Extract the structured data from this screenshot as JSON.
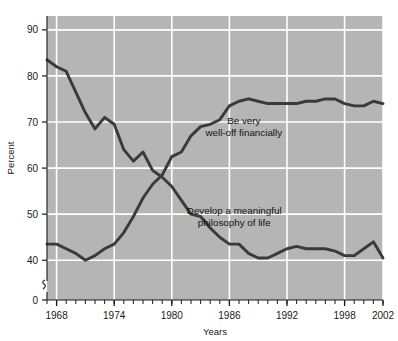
{
  "chart_data": {
    "type": "line",
    "title": "",
    "subtitle": "",
    "xlabel": "Years",
    "ylabel": "Percent",
    "xlim": [
      1967,
      2002
    ],
    "ylim": [
      35.5,
      93
    ],
    "y_axis_break": true,
    "y_break_value": 0,
    "grid": true,
    "grid_color": "#ffffff",
    "plot_background": "#b5b5b5",
    "line_color": "#3a3a3a",
    "legend": "annotations-inline",
    "xticks_major": [
      1968,
      1974,
      1980,
      1986,
      1992,
      1998,
      2002
    ],
    "xtick_labels": [
      "1968",
      "1974",
      "1980",
      "1986",
      "1992",
      "1998",
      "2002"
    ],
    "xticks_minor_every": 1,
    "yticks": [
      0,
      40,
      50,
      60,
      70,
      80,
      90
    ],
    "ytick_labels": [
      "0",
      "40",
      "50",
      "60",
      "70",
      "80",
      "90"
    ],
    "annotations": [
      {
        "id": "well-off",
        "text_line1": "Be very",
        "text_line2": "well-off financially",
        "x": 1987.5,
        "y": 69.5
      },
      {
        "id": "philosophy",
        "text_line1": "Develop a meaningful",
        "text_line2": "philosophy of life",
        "x": 1986.5,
        "y": 50.0
      }
    ],
    "series": [
      {
        "name": "Develop a meaningful philosophy of life",
        "x": [
          1967,
          1968,
          1969,
          1970,
          1971,
          1972,
          1973,
          1974,
          1975,
          1976,
          1977,
          1978,
          1979,
          1980,
          1981,
          1982,
          1983,
          1984,
          1985,
          1986,
          1987,
          1988,
          1989,
          1990,
          1991,
          1992,
          1993,
          1994,
          1995,
          1996,
          1997,
          1998,
          1999,
          2000,
          2001,
          2002
        ],
        "values": [
          83.5,
          82.0,
          81.0,
          76.5,
          72.0,
          68.5,
          71.0,
          69.5,
          64.0,
          61.5,
          63.5,
          59.5,
          58.0,
          56.0,
          53.0,
          50.0,
          49.5,
          47.0,
          45.0,
          43.5,
          43.5,
          41.5,
          40.5,
          40.5,
          41.5,
          42.5,
          43.0,
          42.5,
          42.5,
          42.5,
          42.0,
          41.0,
          41.0,
          42.5,
          44.0,
          40.5
        ]
      },
      {
        "name": "Be very well-off financially",
        "x": [
          1967,
          1968,
          1969,
          1970,
          1971,
          1972,
          1973,
          1974,
          1975,
          1976,
          1977,
          1978,
          1979,
          1980,
          1981,
          1982,
          1983,
          1984,
          1985,
          1986,
          1987,
          1988,
          1989,
          1990,
          1991,
          1992,
          1993,
          1994,
          1995,
          1996,
          1997,
          1998,
          1999,
          2000,
          2001,
          2002
        ],
        "values": [
          43.5,
          43.5,
          42.5,
          41.5,
          40.0,
          41.0,
          42.5,
          43.5,
          46.0,
          49.5,
          53.5,
          56.5,
          58.5,
          62.5,
          63.5,
          67.0,
          69.0,
          69.5,
          70.5,
          73.5,
          74.5,
          75.0,
          74.5,
          74.0,
          74.0,
          74.0,
          74.0,
          74.5,
          74.5,
          75.0,
          75.0,
          74.0,
          73.5,
          73.5,
          74.5,
          74.0
        ]
      }
    ]
  }
}
